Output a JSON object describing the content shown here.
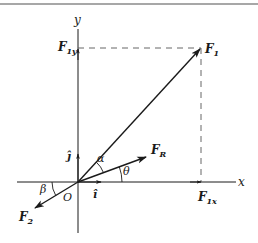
{
  "diagram": {
    "colors": {
      "ink": "#1a1a1a",
      "border": "#8a8a8a",
      "dash": "#555555"
    },
    "axes": {
      "x_label": "x",
      "y_label": "y",
      "origin_label": "O"
    },
    "unit_vectors": {
      "i": "î",
      "j": "ĵ"
    },
    "vectors": {
      "F1": {
        "main": "F",
        "sub": "1"
      },
      "F2": {
        "main": "F",
        "sub": "2"
      },
      "FR": {
        "main": "F",
        "sub": "R"
      }
    },
    "components": {
      "F1x": {
        "main": "F",
        "sub": "1x"
      },
      "F1y": {
        "main": "F",
        "sub": "1y"
      }
    },
    "angles": {
      "alpha": "α",
      "theta": "θ",
      "beta": "β"
    }
  }
}
